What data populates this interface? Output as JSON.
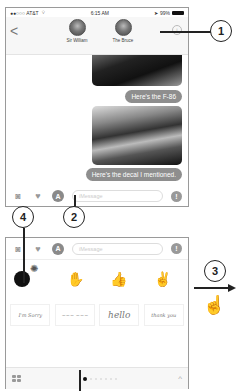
{
  "status_bar": {
    "carrier": "●●○○○ AT&T",
    "wifi_icon": "wifi-icon",
    "time": "6:15 AM",
    "battery_percent": "99%"
  },
  "header": {
    "back_label": "<",
    "contacts": [
      {
        "name": "Sir William"
      },
      {
        "name": "The Bruce"
      }
    ],
    "info_label": "i"
  },
  "messages": [
    {
      "type": "image",
      "description": "F-86 jet photo"
    },
    {
      "type": "text",
      "text": "Here's the F-86"
    },
    {
      "type": "image",
      "description": "decal photo"
    },
    {
      "type": "text",
      "text": "Here's the decal I mentioned."
    }
  ],
  "input_bar": {
    "camera_icon": "camera-icon",
    "digital_touch_icon": "digital-touch-icon",
    "app_store_label": "A",
    "message_placeholder": "iMessage",
    "mic_label": "!"
  },
  "app_drawer": {
    "stickers": [
      "bomb",
      "hand",
      "thumbs",
      "peace"
    ],
    "text_stickers": [
      {
        "label": "I'm Sorry"
      },
      {
        "label": "~~~ ~~~"
      },
      {
        "label": "hello"
      },
      {
        "label": "thank you"
      }
    ],
    "grid_icon": "app-grid-icon",
    "chevron_label": "^"
  },
  "callouts": [
    {
      "number": "1"
    },
    {
      "number": "2"
    },
    {
      "number": "3"
    },
    {
      "number": "4"
    }
  ],
  "colors": {
    "bubble": "#8e8e8e",
    "frame_border": "#9a9a9a",
    "callout": "#222222"
  }
}
